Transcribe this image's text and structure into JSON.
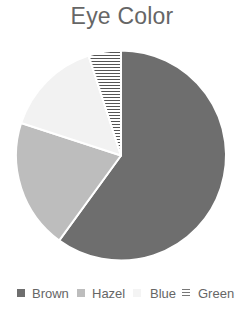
{
  "title": "Eye Color",
  "chart_data": {
    "type": "pie",
    "title": "Eye Color",
    "categories": [
      "Brown",
      "Hazel",
      "Blue",
      "Green"
    ],
    "values": [
      60,
      20,
      15,
      5
    ],
    "colors": [
      "#6e6e6e",
      "#bdbdbd",
      "#f2f2f2",
      "#ffffff"
    ],
    "patterns": [
      "solid",
      "solid",
      "solid",
      "horizontal-stripes"
    ],
    "start_angle_deg": 0,
    "direction": "clockwise",
    "legend_position": "bottom"
  },
  "legend": {
    "items": [
      {
        "label": "Brown",
        "color": "#6e6e6e",
        "pattern": "solid"
      },
      {
        "label": "Hazel",
        "color": "#bdbdbd",
        "pattern": "solid"
      },
      {
        "label": "Blue",
        "color": "#f2f2f2",
        "pattern": "solid"
      },
      {
        "label": "Green",
        "color": "#ffffff",
        "pattern": "horizontal-stripes"
      }
    ]
  }
}
